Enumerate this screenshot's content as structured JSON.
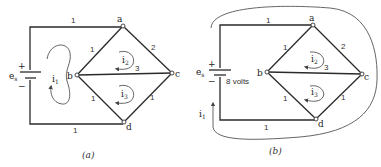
{
  "figures": [
    {
      "id": "a",
      "caption": "(a)",
      "source": {
        "label": "e",
        "subscript": "s",
        "plus": "+",
        "minus": "−",
        "value_label": ""
      },
      "nodes": [
        "a",
        "b",
        "c",
        "d"
      ],
      "branches": [
        {
          "from": "source+",
          "to": "a",
          "resistance": "1"
        },
        {
          "from": "a",
          "to": "b",
          "resistance": "1"
        },
        {
          "from": "a",
          "to": "c",
          "resistance": "2"
        },
        {
          "from": "b",
          "to": "c",
          "resistance": "3"
        },
        {
          "from": "b",
          "to": "d",
          "resistance": "1"
        },
        {
          "from": "c",
          "to": "d",
          "resistance": "1"
        },
        {
          "from": "d",
          "to": "source-",
          "resistance": "1"
        }
      ],
      "loop_currents": [
        {
          "label": "i",
          "subscript": "1"
        },
        {
          "label": "i",
          "subscript": "2"
        },
        {
          "label": "i",
          "subscript": "3"
        }
      ]
    },
    {
      "id": "b",
      "caption": "(b)",
      "source": {
        "label": "e",
        "subscript": "s",
        "plus": "+",
        "minus": "−",
        "value_label": "8 volts"
      },
      "nodes": [
        "a",
        "b",
        "c",
        "d"
      ],
      "branches": [
        {
          "from": "source+",
          "to": "a",
          "resistance": "1"
        },
        {
          "from": "a",
          "to": "b",
          "resistance": "1"
        },
        {
          "from": "a",
          "to": "c",
          "resistance": "2"
        },
        {
          "from": "b",
          "to": "c",
          "resistance": "3"
        },
        {
          "from": "b",
          "to": "d",
          "resistance": "1"
        },
        {
          "from": "c",
          "to": "d",
          "resistance": "1"
        },
        {
          "from": "d",
          "to": "source-",
          "resistance": "1"
        }
      ],
      "loop_currents": [
        {
          "label": "i",
          "subscript": "1"
        },
        {
          "label": "i",
          "subscript": "2"
        },
        {
          "label": "i",
          "subscript": "3"
        }
      ]
    }
  ]
}
